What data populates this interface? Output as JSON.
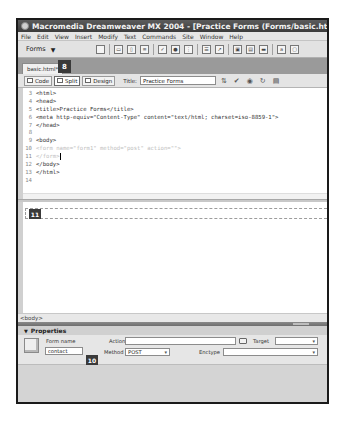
{
  "window": {
    "title": "Macromedia Dreamweaver MX 2004 - [Practice Forms (Forms/basic.html*)]"
  },
  "menubar": {
    "items": [
      "File",
      "Edit",
      "View",
      "Insert",
      "Modify",
      "Text",
      "Commands",
      "Site",
      "Window",
      "Help"
    ]
  },
  "insert_bar": {
    "category": "Forms",
    "caret": "▼",
    "icons": [
      "form-icon",
      "text-field-icon",
      "hidden-field-icon",
      "textarea-icon",
      "checkbox-icon",
      "radio-button-icon",
      "radio-group-icon",
      "list-menu-icon",
      "jump-menu-icon",
      "image-field-icon",
      "file-field-icon",
      "button-icon",
      "label-icon",
      "fieldset-icon"
    ]
  },
  "document": {
    "tab_label": "basic.html*",
    "callouts": {
      "split": "8",
      "design_form": "11",
      "form_name": "10"
    },
    "toolbar": {
      "code_label": "Code",
      "split_label": "Split",
      "design_label": "Design",
      "title_label": "Title:",
      "title_value": "Practice Forms",
      "icons": [
        "file-management-icon",
        "validate-markup-icon",
        "preview-browser-icon",
        "refresh-icon",
        "view-options-icon"
      ]
    },
    "code_lines": [
      {
        "n": "3",
        "text": "<html>",
        "muted": false
      },
      {
        "n": "4",
        "text": "<head>",
        "muted": false
      },
      {
        "n": "5",
        "text": "<title>Practice Forms</title>",
        "muted": false
      },
      {
        "n": "6",
        "text": "<meta http-equiv=\"Content-Type\" content=\"text/html; charset=iso-8859-1\">",
        "muted": false
      },
      {
        "n": "7",
        "text": "</head>",
        "muted": false
      },
      {
        "n": "8",
        "text": "",
        "muted": false
      },
      {
        "n": "9",
        "text": "<body>",
        "muted": false
      },
      {
        "n": "10",
        "text": "<form name=\"form1\" method=\"post\" action=\"\">",
        "muted": true
      },
      {
        "n": "11",
        "text": "</form>",
        "muted": true
      },
      {
        "n": "12",
        "text": "</body>",
        "muted": false
      },
      {
        "n": "13",
        "text": "</html>",
        "muted": false
      },
      {
        "n": "14",
        "text": "",
        "muted": false
      }
    ],
    "tag_selector": "<body>"
  },
  "properties": {
    "header": "Properties",
    "form_name_label": "Form name",
    "form_name_value": "contact",
    "action_label": "Action",
    "action_value": "",
    "target_label": "Target",
    "target_value": "",
    "method_label": "Method",
    "method_value": "POST",
    "enctype_label": "Enctype",
    "enctype_value": ""
  }
}
